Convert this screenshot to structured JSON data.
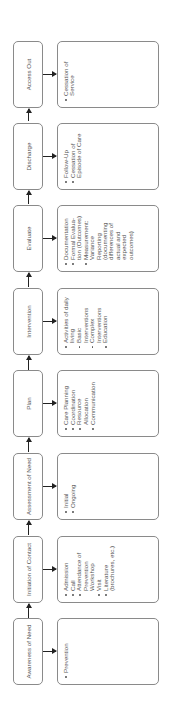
{
  "diagram": {
    "orientation": "rotated-90-ccw",
    "stages": [
      {
        "id": "awareness",
        "label": "Awareness of Need",
        "details": [
          "Prevention"
        ]
      },
      {
        "id": "initiation",
        "label": "Initiation of Contact",
        "details": [
          "Admission",
          "Call",
          "Attendance of Prevention Workshop",
          "Visit",
          "Literature (brochures, etc.)"
        ]
      },
      {
        "id": "assessment",
        "label": "Assessment of Need",
        "details": [
          "Initial",
          "Ongoing"
        ]
      },
      {
        "id": "plan",
        "label": "Plan",
        "details": [
          "Care Planning",
          "Coordination",
          "Resource Allocation",
          "Communication"
        ]
      },
      {
        "id": "intervention",
        "label": "Intervention",
        "details": [
          "Activities of daily living",
          "Basic Interventions",
          "Complex Interventions",
          "Education"
        ]
      },
      {
        "id": "evaluate",
        "label": "Evaluate",
        "details": [
          "Documentation",
          "Formal Evalua-tion (Outcomes)",
          "Measurement: Variance Reporting (documenting differences of actual and expected outcomes)"
        ]
      },
      {
        "id": "discharge",
        "label": "Discharge",
        "details": [
          "Follow-Up",
          "Cessation of Episode of Care"
        ]
      },
      {
        "id": "access-out",
        "label": "Access Out",
        "details": [
          "Cessation of Service"
        ]
      }
    ],
    "colors": {
      "border": "#8a8a8a",
      "text": "#555555",
      "arrow": "#222222",
      "background": "#ffffff"
    }
  }
}
